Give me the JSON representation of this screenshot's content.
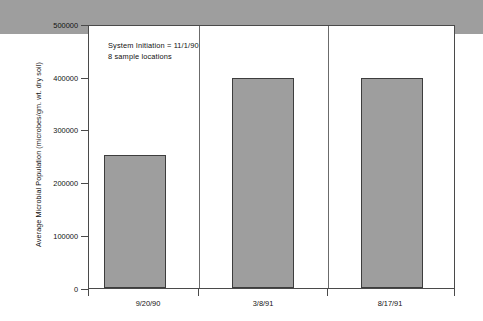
{
  "chart_data": {
    "type": "bar",
    "title": "",
    "subtitle": "",
    "xlabel": "",
    "ylabel": "Average Microbial Population (microbes/gm. wt. dry soil)",
    "categories": [
      "9/20/90",
      "3/8/91",
      "8/17/91"
    ],
    "values": [
      65000,
      252000,
      398000
    ],
    "series": [
      {
        "name": "Average Microbial Population",
        "values": [
          65000,
          252000,
          398000
        ]
      }
    ],
    "ylim": [
      0,
      500000
    ],
    "y_ticks": [
      0,
      100000,
      200000,
      300000,
      400000,
      500000
    ],
    "y_tick_labels": [
      "0",
      "100000",
      "200000",
      "300000",
      "400000",
      "500000"
    ],
    "x_tick_labels": [
      "9/20/90",
      "3/8/91",
      "8/17/91"
    ],
    "grid": false,
    "legend": false,
    "legend_position": "none",
    "bar_fill_color": "#9e9e9e",
    "bar_border_color": "#3d3d3d",
    "axis_color": "#4a4a4a",
    "background_color": "#ffffff",
    "annotations": [
      "System Initiation = 11/1/90",
      "8 sample locations"
    ]
  },
  "annotation": {
    "line1": "System Initiation = 11/1/90",
    "line2": "8 sample locations"
  },
  "axes": {
    "y_title": "Average Microbial Population (microbes/gm. wt. dry soil)",
    "y_labels": {
      "t0": "0",
      "t1": "100000",
      "t2": "200000",
      "t3": "300000",
      "t4": "400000",
      "t5": "500000"
    },
    "x_labels": {
      "c0": "9/20/90",
      "c1": "3/8/91",
      "c2": "8/17/91"
    }
  }
}
